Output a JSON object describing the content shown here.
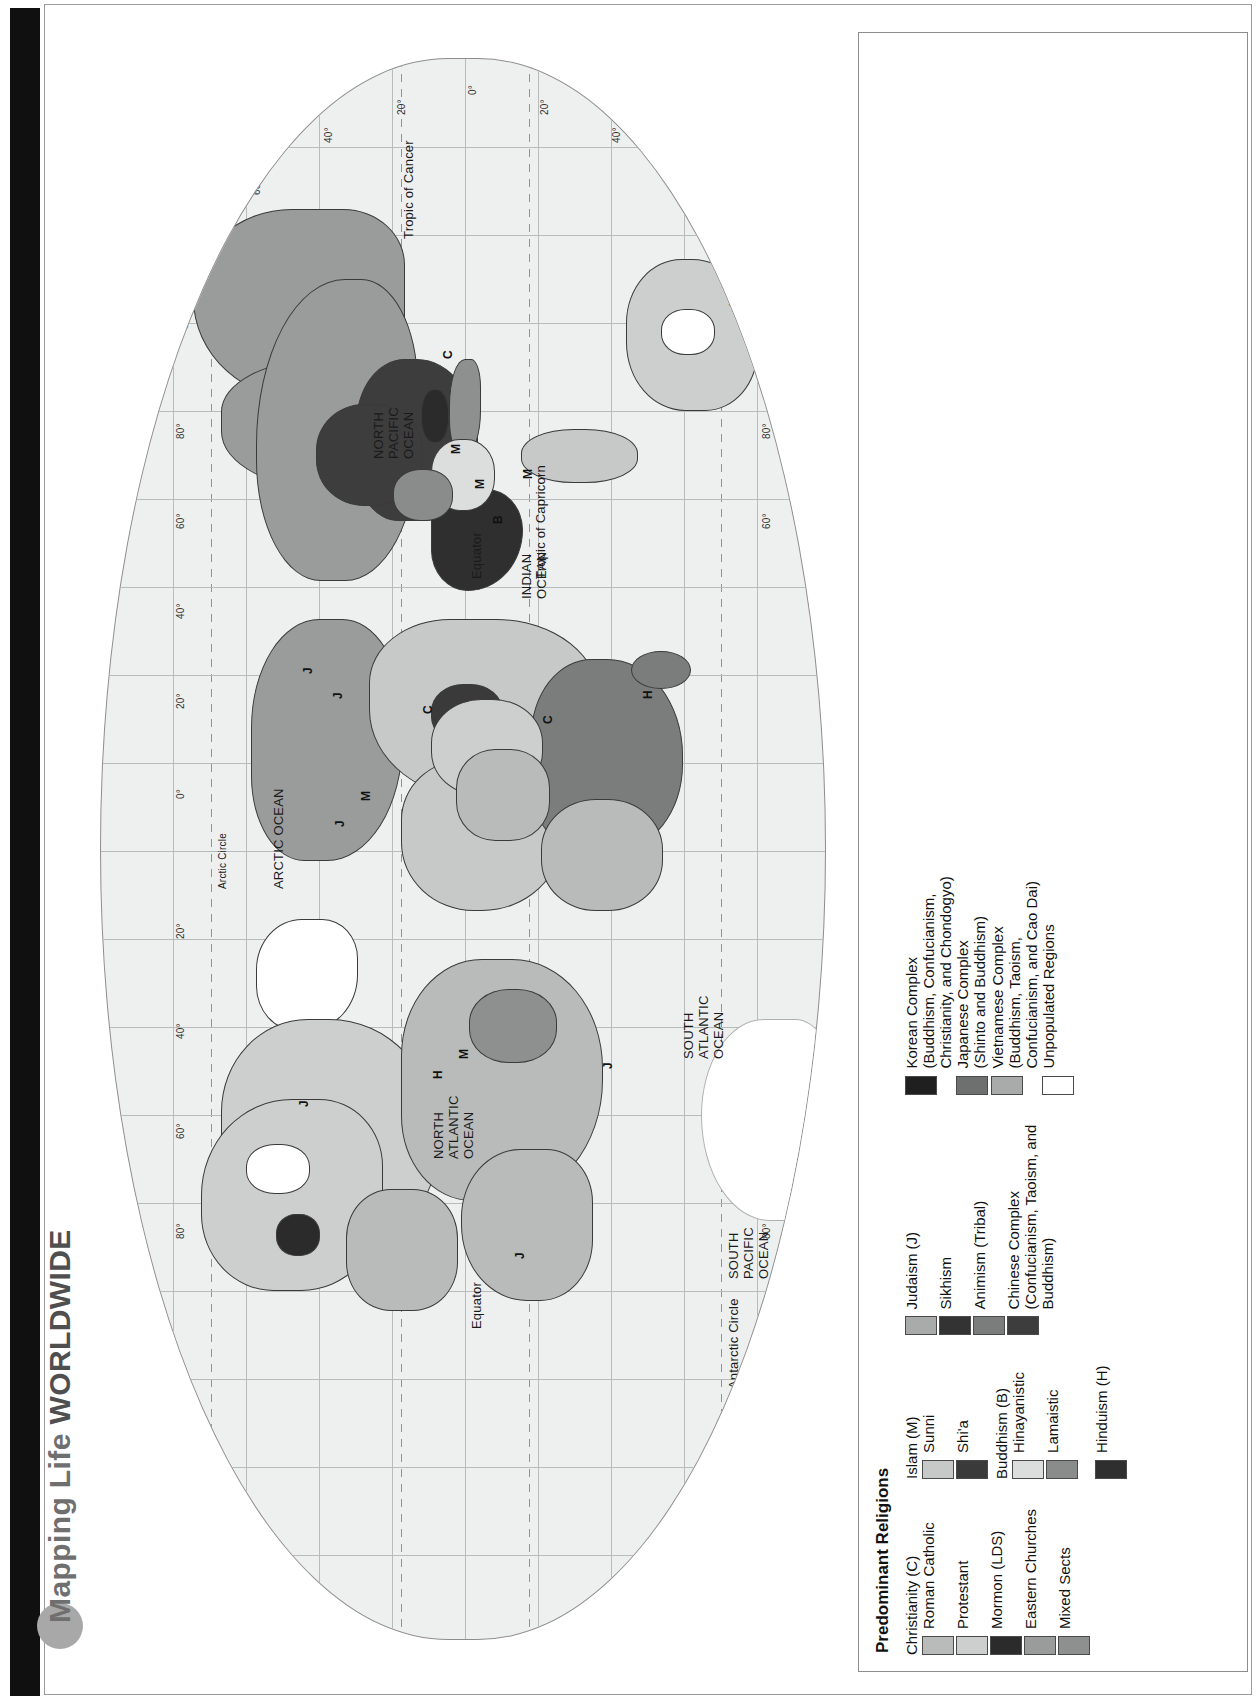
{
  "page": {
    "title_prefix": "Mapping Life ",
    "title_strong": "WORLDWIDE"
  },
  "map": {
    "ocean_labels": [
      "NORTH\nPACIFIC\nOCEAN",
      "ARCTIC OCEAN",
      "NORTH\nATLANTIC\nOCEAN",
      "SOUTH\nATLANTIC\nOCEAN",
      "SOUTH\nPACIFIC\nOCEAN",
      "INDIAN\nOCEAN"
    ],
    "reference_lines": [
      "Tropic of Cancer",
      "Tropic of Capricorn",
      "Equator",
      "Arctic Circle",
      "Antarctic Circle"
    ],
    "longitude_ticks": [
      "0°",
      "20°",
      "40°",
      "60°",
      "80°",
      "100°",
      "120°",
      "140°",
      "160°"
    ],
    "latitude_ticks": [
      "80°",
      "60°",
      "40°",
      "20°",
      "0°"
    ],
    "region_codes": [
      "C",
      "M",
      "B",
      "H",
      "J"
    ],
    "scale": {
      "note": "Scale 1 to 125, 000, 000",
      "miles_label": "2000 Miles",
      "kilometers_label": "3000 Kilometers",
      "miles_ticks": [
        "0",
        "1000",
        "2000"
      ],
      "km_ticks": [
        "0",
        "1000",
        "2000",
        "3000"
      ]
    }
  },
  "legend": {
    "title": "Predominant Religions",
    "columns": [
      {
        "groups": [
          {
            "heading": "Christianity (C)",
            "items": [
              {
                "label": "Roman Catholic",
                "color": "#b9bbbb"
              },
              {
                "label": "Protestant",
                "color": "#cdcfcf"
              },
              {
                "label": "Mormon (LDS)",
                "color": "#2b2b2b"
              },
              {
                "label": "Eastern Churches",
                "color": "#9a9c9c"
              },
              {
                "label": "Mixed Sects",
                "color": "#8e9090"
              }
            ]
          }
        ]
      },
      {
        "groups": [
          {
            "heading": "Islam (M)",
            "items": [
              {
                "label": "Sunni",
                "color": "#c7c9c9"
              },
              {
                "label": "Shi'a",
                "color": "#3a3a3a"
              }
            ]
          },
          {
            "heading": "Buddhism (B)",
            "items": [
              {
                "label": "Hinayanistic",
                "color": "#dcdede"
              },
              {
                "label": "Lamaistic",
                "color": "#8a8c8c"
              }
            ]
          },
          {
            "heading": "",
            "items": [
              {
                "label": "Hinduism (H)",
                "color": "#2f2f2f"
              }
            ]
          }
        ]
      },
      {
        "groups": [
          {
            "heading": "",
            "items": [
              {
                "label": "Judaism (J)",
                "color": "#a9abab"
              },
              {
                "label": "Sikhism",
                "color": "#333333"
              },
              {
                "label": "Animism (Tribal)",
                "color": "#7b7d7d"
              },
              {
                "label": "Chinese Complex\n(Confucianism, Taoism, and\nBuddhism)",
                "color": "#3d3d3d"
              }
            ]
          }
        ]
      },
      {
        "groups": [
          {
            "heading": "",
            "items": [
              {
                "label": "Korean Complex\n(Buddhism, Confucianism,\nChristianity, and Chondogyo)",
                "color": "#1f1f1f"
              },
              {
                "label": "Japanese Complex\n(Shinto and Buddhism)",
                "color": "#6e7070"
              },
              {
                "label": "Vietnamese Complex\n(Buddhism, Taoism,\nConfucianism, and Cao Dai)",
                "color": "#a9abab"
              },
              {
                "label": "Unpopulated Regions",
                "color": "#ffffff"
              }
            ]
          }
        ]
      }
    ]
  }
}
